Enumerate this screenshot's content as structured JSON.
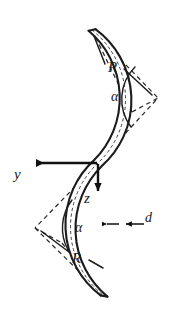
{
  "figure": {
    "background_color": "#ffffff",
    "ink_color": "#1c1c1c"
  },
  "labels": {
    "radius_top": "R",
    "radius_bottom": "R",
    "angle_top": "α",
    "angle_bottom": "α",
    "axis_y": "y",
    "axis_z": "z",
    "thickness": "d"
  },
  "geometry": {
    "origin": {
      "x": 98,
      "y": 163
    },
    "arc_top_center": {
      "x": 158,
      "y": 98
    },
    "arc_bottom_center": {
      "x": 35,
      "y": 228
    },
    "radius_px": 88,
    "angle_deg": 62,
    "thickness_px": 7,
    "strip_top_end": {
      "x": 92,
      "y": 30
    },
    "strip_bottom_end": {
      "x": 104,
      "y": 296
    }
  },
  "axes": {
    "y_axis": {
      "name": "y",
      "direction": "left",
      "from": {
        "x": 98,
        "y": 163
      },
      "to": {
        "x": 30,
        "y": 163
      }
    },
    "z_axis": {
      "name": "z",
      "direction": "down",
      "from": {
        "x": 98,
        "y": 163
      },
      "to": {
        "x": 98,
        "y": 198
      }
    }
  },
  "colors": {
    "stroke": "#1c1c1c",
    "dashed": "#2b2b2b",
    "background": "#ffffff"
  }
}
